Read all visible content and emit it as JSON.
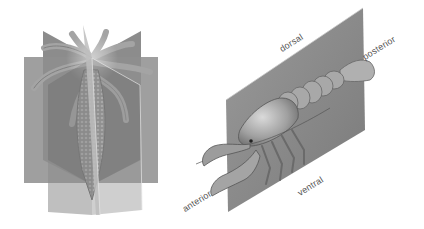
{
  "diagram": {
    "left_figure": {
      "subject": "radially symmetric animal (hydra-like) with multiple symmetry planes",
      "planes": 4
    },
    "right_figure": {
      "subject": "bilaterally symmetric animal (crayfish) with single sagittal plane",
      "labels": {
        "dorsal": "dorsal",
        "posterior": "posterior",
        "anterior": "anterior",
        "ventral": "ventral"
      }
    },
    "colors": {
      "plane": "#8a8a8a",
      "plane_dark": "#6e6e6e",
      "plane_light": "#a8a8a8",
      "animal": "#b5b5b5",
      "label": "#555555"
    }
  }
}
